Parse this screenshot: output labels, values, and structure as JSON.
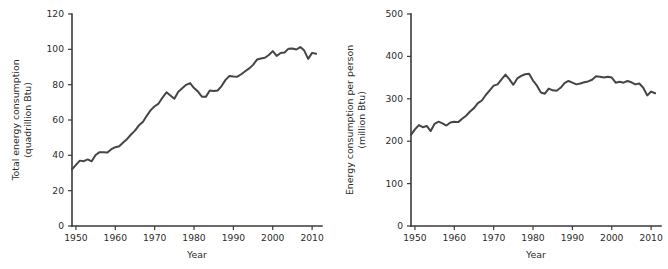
{
  "figure": {
    "panel_count": 2,
    "line_color": "#454545",
    "axis_color": "#3a3a3a",
    "background": "#ffffff"
  },
  "chart_data": [
    {
      "type": "line",
      "panel": "left",
      "title": "",
      "xlabel": "Year",
      "ylabel": "Total energy consumption\n(quadrillion Btu)",
      "ylabel_line1": "Total energy consumption",
      "ylabel_line2": "(quadrillion Btu)",
      "xlim": [
        1949,
        2012
      ],
      "ylim": [
        0,
        120
      ],
      "xticks": [
        1950,
        1960,
        1970,
        1980,
        1990,
        2000,
        2010
      ],
      "xticklabels": [
        "1950",
        "1960",
        "1970",
        "1980",
        "1990",
        "2000",
        "2010"
      ],
      "yticks": [
        0,
        20,
        40,
        60,
        80,
        100,
        120
      ],
      "yticklabels": [
        "0",
        "20",
        "40",
        "60",
        "80",
        "100",
        "120"
      ],
      "grid": false,
      "legend": "none",
      "x": [
        1949,
        1950,
        1951,
        1952,
        1953,
        1954,
        1955,
        1956,
        1957,
        1958,
        1959,
        1960,
        1961,
        1962,
        1963,
        1964,
        1965,
        1966,
        1967,
        1968,
        1969,
        1970,
        1971,
        1972,
        1973,
        1974,
        1975,
        1976,
        1977,
        1978,
        1979,
        1980,
        1981,
        1982,
        1983,
        1984,
        1985,
        1986,
        1987,
        1988,
        1989,
        1990,
        1991,
        1992,
        1993,
        1994,
        1995,
        1996,
        1997,
        1998,
        1999,
        2000,
        2001,
        2002,
        2003,
        2004,
        2005,
        2006,
        2007,
        2008,
        2009,
        2010,
        2011
      ],
      "values": [
        32.0,
        34.6,
        37.0,
        36.7,
        37.7,
        36.6,
        40.2,
        41.8,
        41.8,
        41.6,
        43.5,
        44.6,
        45.1,
        47.3,
        49.3,
        51.8,
        54.0,
        57.0,
        58.9,
        62.4,
        65.6,
        67.8,
        69.3,
        72.7,
        75.7,
        73.9,
        72.0,
        76.0,
        78.0,
        79.9,
        80.9,
        78.1,
        76.1,
        73.2,
        73.1,
        76.7,
        76.4,
        76.7,
        79.2,
        82.7,
        84.9,
        84.6,
        84.5,
        85.9,
        87.6,
        89.2,
        91.2,
        94.2,
        94.8,
        95.2,
        96.8,
        99.0,
        96.3,
        97.9,
        98.2,
        100.4,
        100.5,
        99.9,
        101.3,
        99.3,
        94.6,
        98.0,
        97.5
      ],
      "peak": {
        "year": 2007,
        "value": 101.3
      },
      "units": "quadrillion Btu"
    },
    {
      "type": "line",
      "panel": "right",
      "title": "",
      "xlabel": "Year",
      "ylabel": "Energy consumption per person\n(million Btu)",
      "ylabel_line1": "Energy consumption per person",
      "ylabel_line2": "(million Btu)",
      "xlim": [
        1949,
        2012
      ],
      "ylim": [
        0,
        500
      ],
      "xticks": [
        1950,
        1960,
        1970,
        1980,
        1990,
        2000,
        2010
      ],
      "xticklabels": [
        "1950",
        "1960",
        "1970",
        "1980",
        "1990",
        "2000",
        "2010"
      ],
      "yticks": [
        0,
        100,
        200,
        300,
        400,
        500
      ],
      "yticklabels": [
        "0",
        "100",
        "200",
        "300",
        "400",
        "500"
      ],
      "grid": false,
      "legend": "none",
      "x": [
        1949,
        1950,
        1951,
        1952,
        1953,
        1954,
        1955,
        1956,
        1957,
        1958,
        1959,
        1960,
        1961,
        1962,
        1963,
        1964,
        1965,
        1966,
        1967,
        1968,
        1969,
        1970,
        1971,
        1972,
        1973,
        1974,
        1975,
        1976,
        1977,
        1978,
        1979,
        1980,
        1981,
        1982,
        1983,
        1984,
        1985,
        1986,
        1987,
        1988,
        1989,
        1990,
        1991,
        1992,
        1993,
        1994,
        1995,
        1996,
        1997,
        1998,
        1999,
        2000,
        2001,
        2002,
        2003,
        2004,
        2005,
        2006,
        2007,
        2008,
        2009,
        2010,
        2011
      ],
      "values": [
        215,
        228,
        238,
        233,
        236,
        224,
        241,
        246,
        242,
        237,
        244,
        246,
        245,
        253,
        260,
        270,
        278,
        290,
        296,
        309,
        320,
        331,
        334,
        346,
        357,
        346,
        333,
        348,
        354,
        358,
        359,
        343,
        331,
        315,
        312,
        324,
        320,
        319,
        326,
        337,
        342,
        338,
        334,
        336,
        339,
        341,
        345,
        353,
        352,
        350,
        352,
        350,
        338,
        340,
        338,
        342,
        339,
        334,
        336,
        326,
        308,
        317,
        313
      ],
      "peak": {
        "year": 1978,
        "value": 358
      },
      "units": "million Btu"
    }
  ]
}
